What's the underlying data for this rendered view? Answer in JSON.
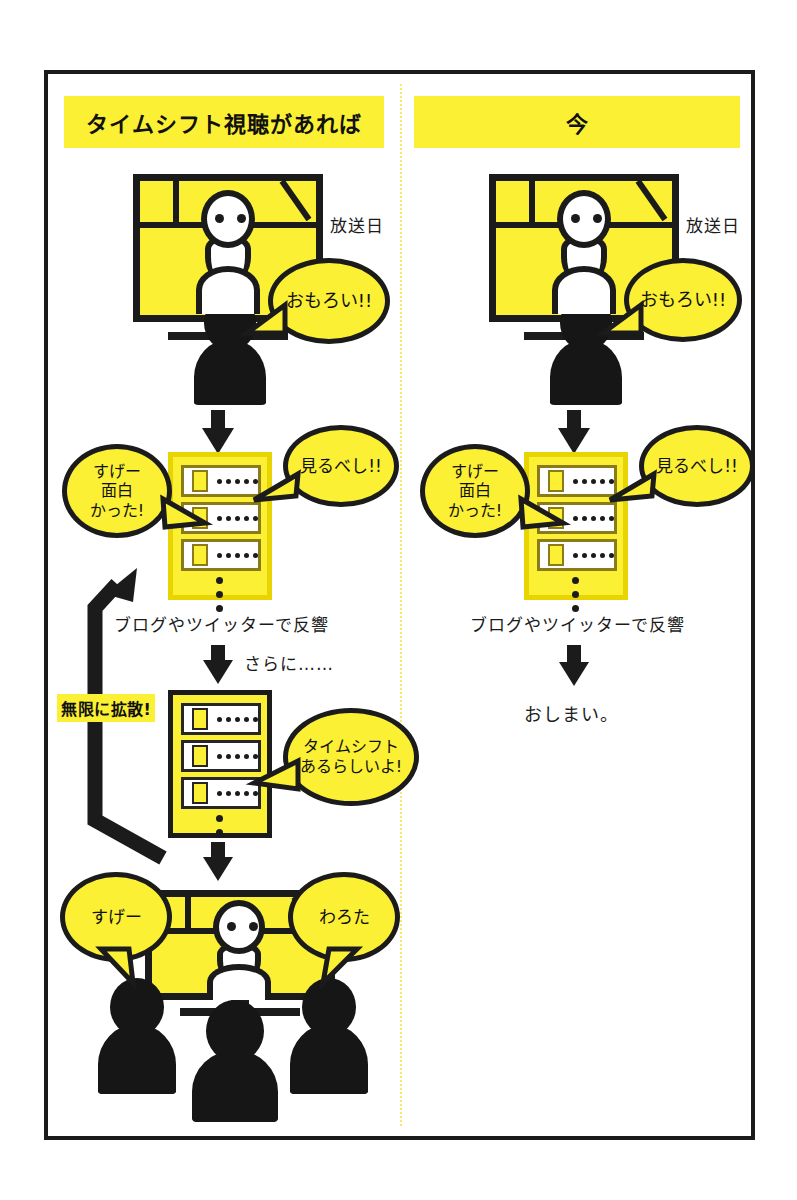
{
  "figure": {
    "title_left": "タイムシフト視聴があれば",
    "title_right": "今"
  },
  "columns": [
    {
      "id": "left",
      "header": "タイムシフト視聴があれば",
      "broadcast_label": "放送日",
      "bubbles": {
        "watch": "おもろい!!",
        "must_see": "見るべし!!",
        "great": "すげー\n面白\nかった!",
        "timeshift": "タイムシフト\nあるらしいよ!",
        "sugee": "すげー",
        "warota": "わろた"
      },
      "captions": {
        "reaction": "ブログやツイッターで反響",
        "further": "さらに……",
        "loop": "無限に拡散!"
      }
    },
    {
      "id": "right",
      "header": "今",
      "broadcast_label": "放送日",
      "bubbles": {
        "watch": "おもろい!!",
        "must_see": "見るべし!!",
        "great": "すげー\n面白\nかった!"
      },
      "captions": {
        "reaction": "ブログやツイッターで反響",
        "end": "おしまい。"
      }
    }
  ],
  "left_bubble_lines": {
    "great": [
      "すげー",
      "面白",
      "かった!"
    ],
    "timeshift": [
      "タイムシフト",
      "あるらしいよ!"
    ]
  },
  "right_bubble_lines": {
    "great": [
      "すげー",
      "面白",
      "かった!"
    ]
  },
  "colors": {
    "yellow": "#fbf033",
    "ink": "#1b1b1b",
    "silhouette": "#161616",
    "divider": "#f7e96a",
    "row_border": "#8a7a18"
  }
}
